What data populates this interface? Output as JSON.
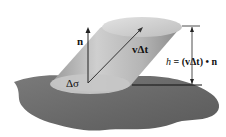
{
  "figure": {
    "type": "flux-cylinder-diagram",
    "labels": {
      "normal": "n",
      "velocity": "vΔt",
      "area": "Δσ",
      "height_h": "h",
      "height_eq": " = (vΔt) • n"
    },
    "colors": {
      "surface": "#6e6e6e",
      "surface_dark": "#555555",
      "cylinder_light": "#d9d9d9",
      "cylinder_mid": "#b8b8b8",
      "cylinder_dark": "#8f8f8f",
      "base_ellipse": "#c4c4c4",
      "line": "#222222"
    }
  }
}
